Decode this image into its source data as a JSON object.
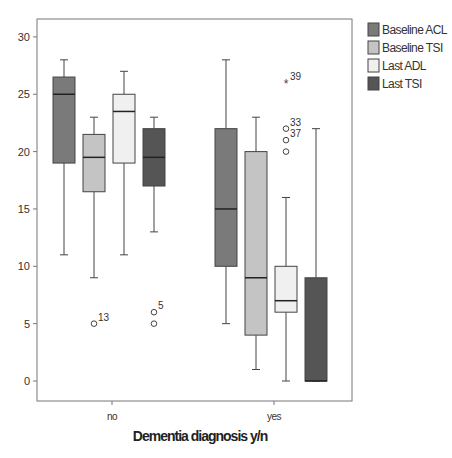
{
  "chart_data": {
    "type": "box",
    "title": "",
    "xlabel": "Dementia diagnosis y/n",
    "ylabel": "",
    "ylim": [
      -1.8,
      31.5
    ],
    "yticks": [
      0,
      5,
      10,
      15,
      20,
      25,
      30
    ],
    "categories": [
      "no",
      "yes"
    ],
    "grid": false,
    "legend_position": "right",
    "series": [
      {
        "name": "Baseline ACL",
        "color": "#7a7a7a",
        "boxes": [
          {
            "category": "no",
            "min": 11,
            "q1": 19,
            "median": 25,
            "q3": 26.5,
            "max": 28,
            "outliers": []
          },
          {
            "category": "yes",
            "min": 5,
            "q1": 10,
            "median": 15,
            "q3": 22,
            "max": 28,
            "outliers": []
          }
        ]
      },
      {
        "name": "Baseline TSI",
        "color": "#c4c4c4",
        "boxes": [
          {
            "category": "no",
            "min": 9,
            "q1": 16.5,
            "median": 19.5,
            "q3": 21.5,
            "max": 23,
            "outliers": [
              {
                "value": 5,
                "label": "13",
                "marker": "circle"
              }
            ]
          },
          {
            "category": "yes",
            "min": 1,
            "q1": 4,
            "median": 9,
            "q3": 20,
            "max": 23,
            "outliers": []
          }
        ]
      },
      {
        "name": "Last ADL",
        "color": "#f0f0f0",
        "boxes": [
          {
            "category": "no",
            "min": 11,
            "q1": 19,
            "median": 23.5,
            "q3": 25,
            "max": 27,
            "outliers": []
          },
          {
            "category": "yes",
            "min": 0,
            "q1": 6,
            "median": 7,
            "q3": 10,
            "max": 16,
            "outliers": [
              {
                "value": 26,
                "label": "39",
                "marker": "star"
              },
              {
                "value": 22,
                "label": "33",
                "marker": "circle"
              },
              {
                "value": 21,
                "label": "37",
                "marker": "circle"
              },
              {
                "value": 20,
                "label": "",
                "marker": "circle"
              }
            ]
          }
        ]
      },
      {
        "name": "Last TSI",
        "color": "#555555",
        "boxes": [
          {
            "category": "no",
            "min": 13,
            "q1": 17,
            "median": 19.5,
            "q3": 22,
            "max": 23,
            "outliers": [
              {
                "value": 6,
                "label": "5",
                "marker": "circle"
              },
              {
                "value": 5,
                "label": "",
                "marker": "circle"
              }
            ]
          },
          {
            "category": "yes",
            "min": 0,
            "q1": 0,
            "median": 0,
            "q3": 9,
            "max": 22,
            "outliers": []
          }
        ]
      }
    ]
  },
  "legend": {
    "items": [
      {
        "label": "Baseline ACL",
        "color": "#7a7a7a"
      },
      {
        "label": "Baseline TSI",
        "color": "#c4c4c4"
      },
      {
        "label": "Last ADL",
        "color": "#f0f0f0"
      },
      {
        "label": "Last TSI",
        "color": "#555555"
      }
    ]
  },
  "axis": {
    "x_tick_labels": [
      "no",
      "yes"
    ],
    "y_tick_labels": [
      "0",
      "5",
      "10",
      "15",
      "20",
      "25",
      "30"
    ],
    "x_title": "Dementia diagnosis y/n"
  }
}
